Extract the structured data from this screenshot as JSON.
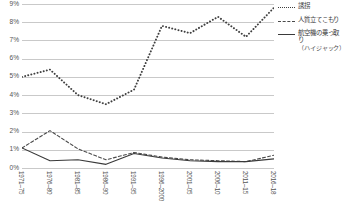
{
  "chart_data": {
    "type": "line",
    "title": "",
    "xlabel": "",
    "ylabel": "",
    "ylim": [
      0,
      9
    ],
    "ytick_labels": [
      "9%",
      "8%",
      "7%",
      "6%",
      "5%",
      "4%",
      "3%",
      "2%",
      "1%",
      "0%"
    ],
    "ytick_values": [
      9,
      8,
      7,
      6,
      5,
      4,
      3,
      2,
      1,
      0
    ],
    "grid": true,
    "legend_position": "right",
    "categories": [
      "1971–75",
      "1976–80",
      "1981–85",
      "1986–90",
      "1991–95",
      "1996–2000",
      "2001–05",
      "2006–10",
      "2011–15",
      "2016–18"
    ],
    "series": [
      {
        "name": "誘拐",
        "style": "dotted",
        "color": "#3f3f3f",
        "values": [
          5.0,
          5.4,
          4.0,
          3.5,
          4.3,
          7.8,
          7.4,
          8.3,
          7.2,
          8.8
        ]
      },
      {
        "name": "人質立てこもり",
        "style": "dashed",
        "color": "#4a4a4a",
        "values": [
          1.1,
          2.05,
          1.05,
          0.45,
          0.85,
          0.6,
          0.45,
          0.4,
          0.35,
          0.7
        ]
      },
      {
        "name": "航空機の乗っ取り",
        "name_sub": "（ハイジャック）",
        "style": "solid",
        "color": "#3a3a3a",
        "values": [
          1.1,
          0.4,
          0.45,
          0.2,
          0.8,
          0.55,
          0.4,
          0.35,
          0.35,
          0.5
        ]
      }
    ]
  },
  "legend": {
    "items": [
      {
        "label": "誘拐",
        "sub": ""
      },
      {
        "label": "人質立てこもり",
        "sub": ""
      },
      {
        "label": "航空機の乗っ取り",
        "sub": "（ハイジャック）"
      }
    ]
  }
}
